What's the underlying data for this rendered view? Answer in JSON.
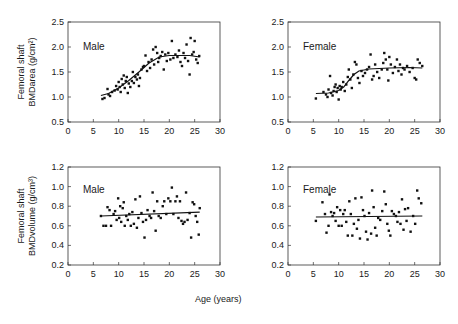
{
  "figure": {
    "xlabel": "Age (years)"
  },
  "chart_data": [
    {
      "type": "scatter",
      "id": "male-area",
      "panel_label": "Male",
      "ylabel_line1": "Femoral shaft",
      "ylabel_line2": "BMDarea (g/cm²)",
      "xlabel": "Age (years)",
      "xlim": [
        0,
        30
      ],
      "ylim": [
        0.5,
        2.5
      ],
      "xticks": [
        0,
        5,
        10,
        15,
        20,
        25,
        30
      ],
      "yticks": [
        "0.5",
        "1.0",
        "1.5",
        "2.0",
        "2.5"
      ],
      "grid": false,
      "fit_line": [
        [
          6.5,
          1.03
        ],
        [
          8,
          1.07
        ],
        [
          10,
          1.18
        ],
        [
          12,
          1.33
        ],
        [
          14,
          1.5
        ],
        [
          16,
          1.68
        ],
        [
          18,
          1.8
        ],
        [
          20,
          1.83
        ],
        [
          22,
          1.83
        ],
        [
          24,
          1.83
        ],
        [
          26,
          1.8
        ]
      ],
      "points": [
        [
          6.8,
          0.96
        ],
        [
          7.2,
          0.98
        ],
        [
          7.8,
          1.16
        ],
        [
          8,
          1.05
        ],
        [
          8.3,
          1.02
        ],
        [
          8.7,
          1.1
        ],
        [
          9.2,
          1.13
        ],
        [
          9.5,
          1.22
        ],
        [
          9.8,
          1.15
        ],
        [
          10,
          1.3
        ],
        [
          10.2,
          1.2
        ],
        [
          10.4,
          1.1
        ],
        [
          10.6,
          1.36
        ],
        [
          10.8,
          1.25
        ],
        [
          11,
          1.43
        ],
        [
          11.2,
          1.18
        ],
        [
          11.4,
          1.32
        ],
        [
          11.6,
          1.4
        ],
        [
          11.8,
          1.08
        ],
        [
          12,
          1.27
        ],
        [
          12.3,
          1.2
        ],
        [
          12.6,
          1.32
        ],
        [
          12.8,
          1.5
        ],
        [
          13,
          1.28
        ],
        [
          13.3,
          1.4
        ],
        [
          13.6,
          1.35
        ],
        [
          13.8,
          1.45
        ],
        [
          14,
          1.22
        ],
        [
          14.2,
          1.38
        ],
        [
          14.5,
          1.55
        ],
        [
          14.8,
          1.6
        ],
        [
          15,
          1.62
        ],
        [
          15.3,
          1.83
        ],
        [
          15.6,
          1.52
        ],
        [
          15.9,
          1.7
        ],
        [
          16.2,
          1.58
        ],
        [
          16.5,
          1.75
        ],
        [
          16.8,
          1.95
        ],
        [
          17,
          1.65
        ],
        [
          17.3,
          2.0
        ],
        [
          17.6,
          1.88
        ],
        [
          17.8,
          1.7
        ],
        [
          18,
          1.78
        ],
        [
          18.3,
          1.82
        ],
        [
          18.6,
          1.9
        ],
        [
          18.9,
          1.55
        ],
        [
          19.2,
          1.85
        ],
        [
          19.5,
          1.72
        ],
        [
          19.8,
          1.88
        ],
        [
          20.2,
          1.75
        ],
        [
          20.5,
          2.12
        ],
        [
          20.8,
          1.78
        ],
        [
          21.2,
          1.85
        ],
        [
          21.6,
          1.8
        ],
        [
          21.9,
          1.93
        ],
        [
          22.2,
          1.7
        ],
        [
          22.5,
          1.62
        ],
        [
          22.8,
          1.88
        ],
        [
          23.1,
          1.78
        ],
        [
          23.4,
          2.05
        ],
        [
          23.7,
          1.72
        ],
        [
          24,
          1.45
        ],
        [
          24.2,
          2.18
        ],
        [
          24.5,
          1.85
        ],
        [
          24.8,
          1.9
        ],
        [
          25,
          2.12
        ],
        [
          25.3,
          1.75
        ],
        [
          25.6,
          1.68
        ],
        [
          25.9,
          1.82
        ]
      ]
    },
    {
      "type": "scatter",
      "id": "female-area",
      "panel_label": "Female",
      "xlabel": "Age (years)",
      "xlim": [
        0,
        30
      ],
      "ylim": [
        0.5,
        2.5
      ],
      "xticks": [
        0,
        5,
        10,
        15,
        20,
        25,
        30
      ],
      "yticks": [
        "0.5",
        "1.0",
        "1.5",
        "2.0",
        "2.5"
      ],
      "grid": false,
      "fit_line": [
        [
          5.5,
          1.07
        ],
        [
          8,
          1.08
        ],
        [
          10,
          1.13
        ],
        [
          11,
          1.2
        ],
        [
          12,
          1.33
        ],
        [
          13,
          1.45
        ],
        [
          14,
          1.52
        ],
        [
          16,
          1.56
        ],
        [
          20,
          1.58
        ],
        [
          24,
          1.59
        ],
        [
          26.5,
          1.58
        ]
      ],
      "points": [
        [
          5.5,
          0.97
        ],
        [
          7,
          1.1
        ],
        [
          7.5,
          1.05
        ],
        [
          7.8,
          1.0
        ],
        [
          8,
          1.15
        ],
        [
          8.3,
          1.42
        ],
        [
          8.5,
          1.08
        ],
        [
          8.8,
          1.03
        ],
        [
          9,
          1.12
        ],
        [
          9.2,
          1.2
        ],
        [
          9.4,
          1.25
        ],
        [
          9.6,
          1.1
        ],
        [
          9.8,
          1.18
        ],
        [
          10,
          0.95
        ],
        [
          10.2,
          1.22
        ],
        [
          10.4,
          1.15
        ],
        [
          10.6,
          1.2
        ],
        [
          10.9,
          1.3
        ],
        [
          11.2,
          1.12
        ],
        [
          11.5,
          1.25
        ],
        [
          11.8,
          1.4
        ],
        [
          12,
          1.55
        ],
        [
          12.3,
          1.35
        ],
        [
          12.6,
          1.18
        ],
        [
          12.9,
          1.45
        ],
        [
          13.2,
          1.7
        ],
        [
          13.5,
          1.65
        ],
        [
          13.8,
          1.38
        ],
        [
          14.1,
          1.28
        ],
        [
          14.5,
          1.52
        ],
        [
          14.8,
          1.42
        ],
        [
          15.2,
          1.48
        ],
        [
          15.6,
          1.55
        ],
        [
          16,
          1.6
        ],
        [
          16.3,
          1.85
        ],
        [
          16.6,
          1.35
        ],
        [
          16.9,
          1.42
        ],
        [
          17.2,
          1.65
        ],
        [
          17.6,
          1.5
        ],
        [
          18,
          1.38
        ],
        [
          18.5,
          1.55
        ],
        [
          18.8,
          1.68
        ],
        [
          19,
          1.88
        ],
        [
          19.3,
          1.75
        ],
        [
          19.6,
          1.55
        ],
        [
          19.8,
          1.33
        ],
        [
          20,
          1.8
        ],
        [
          20.3,
          1.65
        ],
        [
          20.7,
          1.48
        ],
        [
          21.1,
          1.6
        ],
        [
          21.5,
          1.75
        ],
        [
          21.8,
          1.52
        ],
        [
          22.1,
          1.65
        ],
        [
          22.4,
          1.45
        ],
        [
          22.7,
          1.58
        ],
        [
          23,
          1.55
        ],
        [
          23.5,
          1.62
        ],
        [
          24,
          1.5
        ],
        [
          24.6,
          1.58
        ],
        [
          25,
          1.38
        ],
        [
          25.3,
          1.35
        ],
        [
          25.6,
          1.75
        ],
        [
          26,
          1.68
        ],
        [
          26.5,
          1.62
        ]
      ]
    },
    {
      "type": "scatter",
      "id": "male-volume",
      "panel_label": "Male",
      "ylabel_line1": "Femoral shaft",
      "ylabel_line2": "BMDvolume (g/cm³)",
      "xlabel": "Age (years)",
      "xlim": [
        0,
        30
      ],
      "ylim": [
        0.2,
        1.2
      ],
      "xticks": [
        0,
        5,
        10,
        15,
        20,
        25,
        30
      ],
      "yticks": [
        "0.2",
        "0.4",
        "0.6",
        "0.8",
        "1.0",
        "1.2"
      ],
      "grid": false,
      "fit_line": [
        [
          6.5,
          0.7
        ],
        [
          26,
          0.74
        ]
      ],
      "points": [
        [
          6.5,
          0.7
        ],
        [
          7,
          0.6
        ],
        [
          7.5,
          0.6
        ],
        [
          7.8,
          0.79
        ],
        [
          8.2,
          0.76
        ],
        [
          8.5,
          0.6
        ],
        [
          9,
          0.72
        ],
        [
          9.3,
          0.75
        ],
        [
          9.6,
          0.66
        ],
        [
          9.9,
          0.88
        ],
        [
          10.1,
          0.68
        ],
        [
          10.3,
          0.8
        ],
        [
          10.5,
          0.64
        ],
        [
          10.8,
          0.78
        ],
        [
          11,
          0.84
        ],
        [
          11.2,
          0.6
        ],
        [
          11.5,
          0.7
        ],
        [
          11.8,
          0.66
        ],
        [
          12.1,
          0.72
        ],
        [
          12.4,
          0.6
        ],
        [
          12.7,
          0.74
        ],
        [
          13,
          0.62
        ],
        [
          13.3,
          0.87
        ],
        [
          13.6,
          0.58
        ],
        [
          13.9,
          0.68
        ],
        [
          14.2,
          0.9
        ],
        [
          14.5,
          0.73
        ],
        [
          14.8,
          0.64
        ],
        [
          15.1,
          0.48
        ],
        [
          15.4,
          0.66
        ],
        [
          15.7,
          0.76
        ],
        [
          16.1,
          0.7
        ],
        [
          16.4,
          0.68
        ],
        [
          16.7,
          0.94
        ],
        [
          17,
          0.75
        ],
        [
          17.3,
          0.55
        ],
        [
          17.6,
          0.85
        ],
        [
          17.9,
          0.7
        ],
        [
          18.3,
          0.68
        ],
        [
          18.7,
          0.8
        ],
        [
          19,
          0.85
        ],
        [
          19.4,
          0.72
        ],
        [
          19.8,
          0.88
        ],
        [
          20.2,
          0.85
        ],
        [
          20.5,
          0.99
        ],
        [
          20.8,
          0.72
        ],
        [
          21.2,
          0.85
        ],
        [
          21.5,
          0.9
        ],
        [
          21.8,
          0.68
        ],
        [
          22.1,
          0.85
        ],
        [
          22.4,
          0.65
        ],
        [
          22.7,
          0.62
        ],
        [
          23,
          0.64
        ],
        [
          23.3,
          0.94
        ],
        [
          23.6,
          0.66
        ],
        [
          24,
          0.73
        ],
        [
          24.3,
          0.48
        ],
        [
          24.6,
          0.84
        ],
        [
          24.9,
          0.82
        ],
        [
          25.2,
          0.7
        ],
        [
          25.5,
          0.64
        ],
        [
          25.8,
          0.51
        ],
        [
          26,
          0.78
        ]
      ]
    },
    {
      "type": "scatter",
      "id": "female-volume",
      "panel_label": "Female",
      "xlabel": "Age (years)",
      "xlim": [
        0,
        30
      ],
      "ylim": [
        0.2,
        1.2
      ],
      "xticks": [
        0,
        5,
        10,
        15,
        20,
        25,
        30
      ],
      "yticks": [
        "0.2",
        "0.4",
        "0.6",
        "0.8",
        "1.0",
        "1.2"
      ],
      "grid": false,
      "fit_line": [
        [
          5.5,
          0.69
        ],
        [
          26.5,
          0.7
        ]
      ],
      "points": [
        [
          5.5,
          0.65
        ],
        [
          6.8,
          0.84
        ],
        [
          7.3,
          0.72
        ],
        [
          7.6,
          0.53
        ],
        [
          8,
          0.6
        ],
        [
          8.2,
          0.92
        ],
        [
          8.5,
          0.74
        ],
        [
          8.8,
          0.7
        ],
        [
          9.1,
          0.73
        ],
        [
          9.4,
          0.65
        ],
        [
          9.7,
          0.79
        ],
        [
          10,
          0.6
        ],
        [
          10.3,
          0.76
        ],
        [
          10.6,
          0.6
        ],
        [
          10.9,
          0.72
        ],
        [
          11.2,
          0.76
        ],
        [
          11.5,
          0.64
        ],
        [
          11.8,
          0.5
        ],
        [
          12.1,
          0.85
        ],
        [
          12.4,
          0.72
        ],
        [
          12.7,
          0.5
        ],
        [
          13,
          0.62
        ],
        [
          13.3,
          0.88
        ],
        [
          13.6,
          0.57
        ],
        [
          13.9,
          0.66
        ],
        [
          14.2,
          0.47
        ],
        [
          14.5,
          0.89
        ],
        [
          14.8,
          0.76
        ],
        [
          15.1,
          0.7
        ],
        [
          15.4,
          0.54
        ],
        [
          15.7,
          0.46
        ],
        [
          16,
          0.73
        ],
        [
          16.4,
          0.52
        ],
        [
          16.6,
          0.96
        ],
        [
          16.9,
          0.79
        ],
        [
          17.2,
          0.58
        ],
        [
          17.5,
          0.5
        ],
        [
          17.8,
          0.68
        ],
        [
          18.2,
          0.66
        ],
        [
          18.6,
          0.75
        ],
        [
          19,
          0.95
        ],
        [
          19.3,
          0.82
        ],
        [
          19.6,
          0.62
        ],
        [
          19.9,
          0.55
        ],
        [
          20.2,
          0.5
        ],
        [
          20.5,
          0.75
        ],
        [
          20.9,
          0.72
        ],
        [
          21.3,
          0.7
        ],
        [
          21.6,
          0.64
        ],
        [
          21.9,
          0.74
        ],
        [
          22.2,
          0.62
        ],
        [
          22.5,
          0.87
        ],
        [
          22.8,
          0.56
        ],
        [
          23.1,
          0.77
        ],
        [
          23.4,
          0.65
        ],
        [
          23.7,
          0.78
        ],
        [
          24.2,
          0.54
        ],
        [
          24.7,
          0.7
        ],
        [
          25.1,
          0.62
        ],
        [
          25.5,
          0.96
        ],
        [
          25.8,
          0.88
        ],
        [
          26.3,
          0.83
        ]
      ]
    }
  ]
}
